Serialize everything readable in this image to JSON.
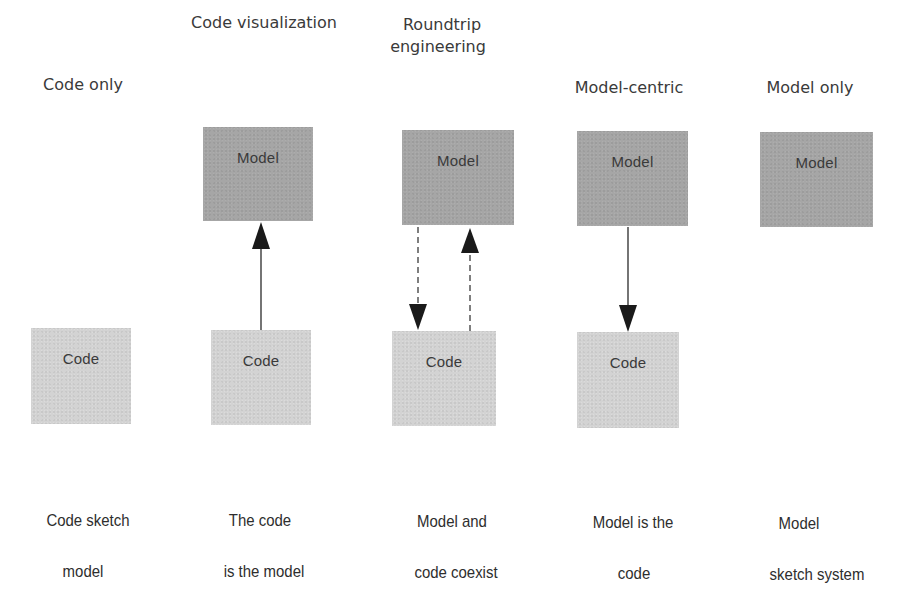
{
  "diagram": {
    "columns": [
      {
        "id": "code-only",
        "heading": [
          "Code only"
        ],
        "caption": [
          "Code sketch",
          "model"
        ],
        "model_box": null,
        "code_box": "Code",
        "connection": "none"
      },
      {
        "id": "code-visualization",
        "heading": [
          "Code visualization"
        ],
        "caption": [
          "The  code",
          "is the model"
        ],
        "model_box": "Model",
        "code_box": "Code",
        "connection": "solid arrow from Code up to Model"
      },
      {
        "id": "roundtrip-engineering",
        "heading": [
          "Roundtrip",
          "engineering"
        ],
        "caption": [
          "Model and",
          "code coexist"
        ],
        "model_box": "Model",
        "code_box": "Code",
        "connection": "dashed arrows both directions (Model down to Code, Code up to Model)"
      },
      {
        "id": "model-centric",
        "heading": [
          "Model-centric"
        ],
        "caption": [
          "Model is the",
          "code"
        ],
        "model_box": "Model",
        "code_box": "Code",
        "connection": "solid arrow from Model down to Code"
      },
      {
        "id": "model-only",
        "heading": [
          "Model only"
        ],
        "caption": [
          "Model",
          "sketch system"
        ],
        "model_box": "Model",
        "code_box": null,
        "connection": "none"
      }
    ],
    "colors": {
      "model_fill": "#a6a6a6",
      "code_fill": "#d3d3d3",
      "arrow": "#1a1a1a",
      "text": "#333333",
      "background": "#ffffff"
    }
  }
}
